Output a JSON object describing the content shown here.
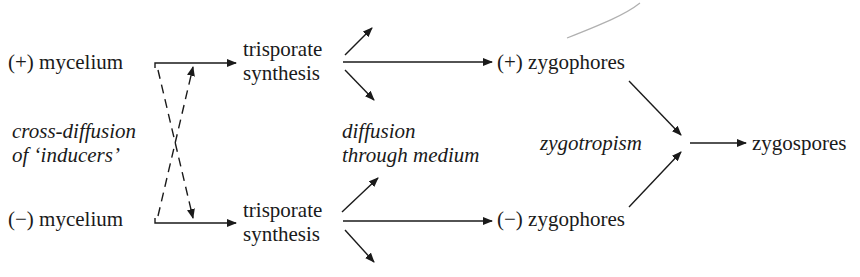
{
  "diagram": {
    "type": "flow",
    "nodes": {
      "plus_mycelium": "(+) mycelium",
      "minus_mycelium": "(−) mycelium",
      "plus_trisporate_1": "trisporate",
      "plus_trisporate_2": "synthesis",
      "minus_trisporate_1": "trisporate",
      "minus_trisporate_2": "synthesis",
      "plus_zygophores": "(+) zygophores",
      "minus_zygophores": "(−) zygophores",
      "zygospores": "zygospores"
    },
    "annotations": {
      "cross_diffusion_1": "cross-diffusion",
      "cross_diffusion_2": "of ‘inducers’",
      "diffusion_1": "diffusion",
      "diffusion_2": "through medium",
      "zygotropism": "zygotropism"
    },
    "edges": [
      {
        "from": "(+) mycelium",
        "to": "trisporate synthesis (+)",
        "style": "solid"
      },
      {
        "from": "(−) mycelium",
        "to": "trisporate synthesis (−)",
        "style": "solid"
      },
      {
        "from": "(+) mycelium",
        "to": "(−) branch",
        "style": "dashed",
        "label": "cross-diffusion of 'inducers'"
      },
      {
        "from": "(−) mycelium",
        "to": "(+) branch",
        "style": "dashed",
        "label": "cross-diffusion of 'inducers'"
      },
      {
        "from": "trisporate synthesis (+)",
        "to": "(+) zygophores",
        "style": "solid"
      },
      {
        "from": "trisporate synthesis (−)",
        "to": "(−) zygophores",
        "style": "solid"
      },
      {
        "from": "trisporate synthesis",
        "to": "medium",
        "style": "solid",
        "label": "diffusion through medium"
      },
      {
        "from": "(+) zygophores",
        "to": "junction",
        "style": "solid",
        "label": "zygotropism"
      },
      {
        "from": "(−) zygophores",
        "to": "junction",
        "style": "solid",
        "label": "zygotropism"
      },
      {
        "from": "junction",
        "to": "zygospores",
        "style": "solid"
      }
    ]
  }
}
